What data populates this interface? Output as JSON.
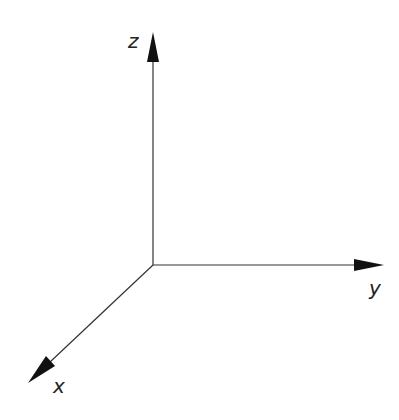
{
  "diagram": {
    "origin": [
      153,
      265
    ],
    "axes": [
      {
        "name": "z",
        "label": "z",
        "tip": [
          153,
          32
        ]
      },
      {
        "name": "y",
        "label": "y",
        "tip": [
          384,
          265
        ]
      },
      {
        "name": "x",
        "label": "x",
        "tip": [
          28,
          383
        ]
      }
    ],
    "stroke_color": "#222222"
  }
}
